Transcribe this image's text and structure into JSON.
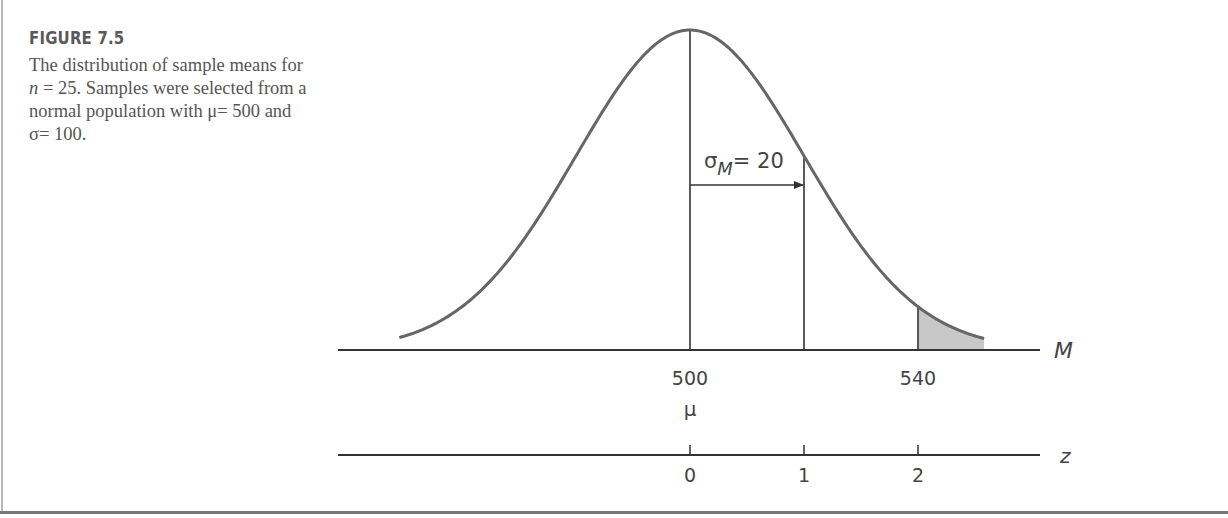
{
  "figure": {
    "title": "FIGURE 7.5",
    "caption_parts": {
      "p1": "The distribution of sample means for ",
      "n_var": "n",
      "p2": " = 25. Samples were selected from a normal population with μ= 500 and σ= 100."
    }
  },
  "chart_data": {
    "type": "area",
    "title": "Distribution of sample means for n = 25",
    "distribution": "normal",
    "mean": 500,
    "std_error": 20,
    "population": {
      "mu": 500,
      "sigma": 100
    },
    "sample_size": 25,
    "curve_range_z": [
      -2.55,
      2.58
    ],
    "shaded_region": {
      "from_M": 540,
      "to_z": 2.58,
      "from_z": 2,
      "tail": "right"
    },
    "vertical_lines_z": [
      0,
      1,
      2
    ],
    "annotation": {
      "symbol": "σ",
      "subscript": "M",
      "text": "= 20",
      "arrow_from_z": 0,
      "arrow_to_z": 1
    },
    "m_axis": {
      "label": "M",
      "ticks": [
        {
          "z": 0,
          "label": "500",
          "sublabel": "μ"
        },
        {
          "z": 2,
          "label": "540",
          "sublabel": ""
        }
      ]
    },
    "z_axis": {
      "label": "z",
      "ticks": [
        {
          "z": 0,
          "label": "0"
        },
        {
          "z": 1,
          "label": "1"
        },
        {
          "z": 2,
          "label": "2"
        }
      ]
    },
    "colors": {
      "curve": "#666666",
      "line": "#333333",
      "shade": "#c8c8c8",
      "text": "#444444"
    }
  }
}
